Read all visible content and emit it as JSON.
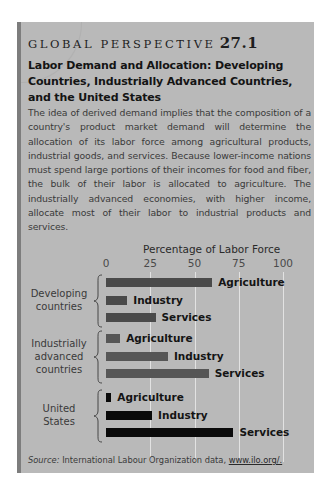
{
  "header": {
    "kicker": "GLOBAL PERSPECTIVE",
    "number": "27.1",
    "title": "Labor Demand and Allocation: Developing Countries, Industrially Advanced Countries, and the United States"
  },
  "body": "The idea of derived demand implies that the composition of a country's product market demand will determine the allocation of its labor force among agricultural products, industrial goods, and services. Because lower-income nations must spend large portions of their incomes for food and fiber, the bulk of their labor is allocated to agriculture. The industrially advanced economies, with higher income, allocate most of their labor to industrial products and services.",
  "source": {
    "label": "Source:",
    "text": "International Labour Organization data,",
    "link": "www.ilo.org/."
  },
  "colors": {
    "panel": "#b9b9b9",
    "bar_developing": "#4a4a4a",
    "bar_advanced": "#565656",
    "bar_us": "#0a0a0a",
    "gridline": "#e2e2e2"
  },
  "chart_data": {
    "type": "bar",
    "orientation": "horizontal",
    "title": "Percentage of Labor Force",
    "xlabel": "Percentage of Labor Force",
    "ylabel": "",
    "xlim": [
      0,
      100
    ],
    "x_ticks": [
      "0",
      "25",
      "50",
      "75",
      "100"
    ],
    "grid": true,
    "legend": "none (bars labeled directly)",
    "categories": [
      "Agriculture",
      "Industry",
      "Services"
    ],
    "groups": [
      {
        "name": "Developing countries",
        "label_lines": [
          "Developing",
          "countries"
        ],
        "values": [
          60,
          12,
          28
        ]
      },
      {
        "name": "Industrially advanced countries",
        "label_lines": [
          "Industrially",
          "advanced",
          "countries"
        ],
        "values": [
          8,
          35,
          58
        ]
      },
      {
        "name": "United States",
        "label_lines": [
          "United",
          "States"
        ],
        "values": [
          3,
          26,
          72
        ]
      }
    ]
  }
}
